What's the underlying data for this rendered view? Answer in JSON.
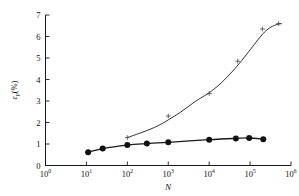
{
  "chart_data": {
    "type": "line",
    "title": "",
    "xlabel": "N",
    "ylabel": "εp(%)",
    "ylabel_parts": {
      "symbol": "ε",
      "subscript": "p",
      "unit": "(%)"
    },
    "xscale": "log",
    "yscale": "linear",
    "xlim": [
      1,
      1000000
    ],
    "ylim": [
      0,
      7
    ],
    "xticks": [
      1,
      10,
      100,
      1000,
      10000,
      100000,
      1000000
    ],
    "xtick_labels": [
      "10⁰",
      "10¹",
      "10²",
      "10³",
      "10⁴",
      "10⁵",
      "10⁶"
    ],
    "xtick_mantissa": [
      "10",
      "10",
      "10",
      "10",
      "10",
      "10",
      "10"
    ],
    "xtick_exponents": [
      "0",
      "1",
      "2",
      "3",
      "4",
      "5",
      "6"
    ],
    "yticks": [
      0,
      1,
      2,
      3,
      4,
      5,
      6,
      7
    ],
    "ytick_labels": [
      "0",
      "1",
      "2",
      "3",
      "4",
      "5",
      "6",
      "7"
    ],
    "grid": false,
    "legend": "none",
    "series": [
      {
        "name": "upper-curve",
        "marker": "cross",
        "x": [
          100,
          1000,
          10000,
          50000,
          200000,
          500000
        ],
        "values": [
          1.3,
          2.3,
          3.35,
          4.85,
          6.35,
          6.6
        ],
        "line_x": [
          100,
          200,
          400,
          700,
          1000,
          2000,
          4000,
          7000,
          10000,
          20000,
          40000,
          70000,
          100000,
          200000,
          300000,
          400000,
          500000,
          600000
        ],
        "line_y": [
          1.3,
          1.5,
          1.72,
          1.95,
          2.12,
          2.48,
          2.9,
          3.2,
          3.38,
          3.85,
          4.45,
          5.0,
          5.38,
          6.1,
          6.4,
          6.52,
          6.58,
          6.6
        ]
      },
      {
        "name": "lower-curve",
        "marker": "filled-circle",
        "x": [
          11,
          25,
          100,
          300,
          1000,
          10000,
          45000,
          95000,
          210000
        ],
        "values": [
          0.62,
          0.79,
          0.95,
          1.02,
          1.08,
          1.2,
          1.26,
          1.28,
          1.22
        ],
        "line_x": [
          11,
          25,
          100,
          300,
          1000,
          10000,
          45000,
          95000,
          210000
        ],
        "line_y": [
          0.62,
          0.79,
          0.95,
          1.02,
          1.08,
          1.2,
          1.26,
          1.28,
          1.22
        ]
      }
    ]
  },
  "axes": {
    "x_axis_name": "x-axis",
    "y_axis_name": "y-axis"
  }
}
